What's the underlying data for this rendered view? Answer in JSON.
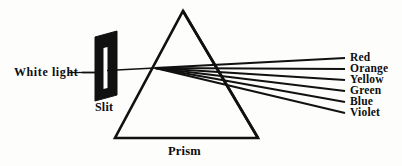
{
  "diagram": {
    "title_label": "Prism",
    "source_label": "White light",
    "aperture_label": "Slit",
    "ink_color": "#111111",
    "background_color": "#fdfdfb",
    "spectrum": [
      {
        "name": "Red",
        "label": "Red",
        "ray_end_y": 58,
        "label_y": 53
      },
      {
        "name": "Orange",
        "label": "Orange",
        "ray_end_y": 69,
        "label_y": 64
      },
      {
        "name": "Yellow",
        "label": "Yellow",
        "ray_end_y": 80,
        "label_y": 75
      },
      {
        "name": "Green",
        "label": "Green",
        "ray_end_y": 91,
        "label_y": 86
      },
      {
        "name": "Blue",
        "label": "Blue",
        "ray_end_y": 102,
        "label_y": 97
      },
      {
        "name": "Violet",
        "label": "Violet",
        "ray_end_y": 113,
        "label_y": 108
      }
    ],
    "geometry": {
      "prism_apex": [
        183,
        11
      ],
      "prism_base_left": [
        115,
        138
      ],
      "prism_base_right": [
        258,
        138
      ],
      "refraction_point": [
        155,
        68
      ],
      "incident_ray_start": [
        82,
        72
      ],
      "ray_label_x": 345,
      "slit_rect": [
        93,
        32,
        24,
        68
      ]
    }
  }
}
